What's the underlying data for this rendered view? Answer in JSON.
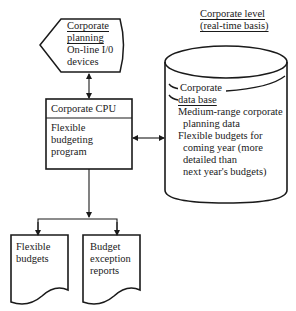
{
  "diagram": {
    "corporate_level": {
      "line1": "Corporate level",
      "line2": "(real-time basis)"
    },
    "planning_display": {
      "title1": "Corporate",
      "title2": "planning",
      "line3": "On-line I/0",
      "line4": "devices"
    },
    "cpu": {
      "title": "Corporate CPU",
      "body1": "Flexible",
      "body2": "budgeting",
      "body3": "program"
    },
    "database": {
      "title1": "Corporate",
      "title2": "data base",
      "item1_line1": "Medium-range corporate",
      "item1_line2": "planning data",
      "item2_line1": "Flexible budgets for",
      "item2_line2": "coming year (more",
      "item2_line3": "detailed than",
      "item2_line4": "next year's budgets)"
    },
    "documents": [
      {
        "line1": "Flexible",
        "line2": "budgets"
      },
      {
        "line1": "Budget",
        "line2": "exception",
        "line3": "reports"
      }
    ],
    "colors": {
      "stroke": "#1a1a1a",
      "background": "#ffffff"
    }
  }
}
